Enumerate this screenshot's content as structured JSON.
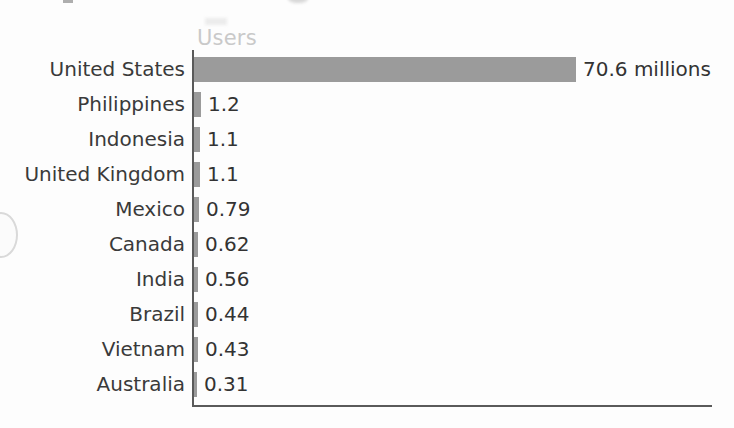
{
  "chart_data": {
    "type": "bar",
    "orientation": "horizontal",
    "title": "",
    "xlabel": "",
    "ylabel": "",
    "column_header": "Users",
    "unit_note": "millions",
    "categories": [
      "United States",
      "Philippines",
      "Indonesia",
      "United Kingdom",
      "Mexico",
      "Canada",
      "India",
      "Brazil",
      "Vietnam",
      "Australia"
    ],
    "values": [
      70.6,
      1.2,
      1.1,
      1.1,
      0.79,
      0.62,
      0.56,
      0.44,
      0.43,
      0.31
    ],
    "value_labels": [
      "70.6 millions",
      "1.2",
      "1.1",
      "1.1",
      "0.79",
      "0.62",
      "0.56",
      "0.44",
      "0.43",
      "0.31"
    ],
    "xlim": [
      0,
      70.6
    ],
    "grid": false,
    "legend": false,
    "bar_color": "#9b9b9b",
    "label_color": "#3a3a3a",
    "header_color": "#c9c9c9",
    "axis_color": "#5a5a5a"
  },
  "rows": [
    {
      "label": "United States",
      "value": 70.6,
      "value_label": "70.6 millions",
      "bar_width_px": 382
    },
    {
      "label": "Philippines",
      "value": 1.2,
      "value_label": "1.2",
      "bar_width_px": 7
    },
    {
      "label": "Indonesia",
      "value": 1.1,
      "value_label": "1.1",
      "bar_width_px": 6
    },
    {
      "label": "United Kingdom",
      "value": 1.1,
      "value_label": "1.1",
      "bar_width_px": 6
    },
    {
      "label": "Mexico",
      "value": 0.79,
      "value_label": "0.79",
      "bar_width_px": 5
    },
    {
      "label": "Canada",
      "value": 0.62,
      "value_label": "0.62",
      "bar_width_px": 4
    },
    {
      "label": "India",
      "value": 0.56,
      "value_label": "0.56",
      "bar_width_px": 4
    },
    {
      "label": "Brazil",
      "value": 0.44,
      "value_label": "0.44",
      "bar_width_px": 4
    },
    {
      "label": "Vietnam",
      "value": 0.43,
      "value_label": "0.43",
      "bar_width_px": 4
    },
    {
      "label": "Australia",
      "value": 0.31,
      "value_label": "0.31",
      "bar_width_px": 3
    }
  ]
}
